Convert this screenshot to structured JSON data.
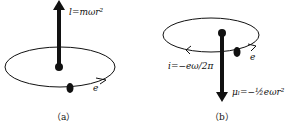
{
  "panels": [
    {
      "id": "a",
      "caption": "（a）",
      "vector_label": "l=mωr²",
      "charge_label": "e"
    },
    {
      "id": "b",
      "caption": "（b）",
      "vector_label": "μₗ=−½eωr²",
      "current_label": "i=−eω/2π",
      "charge_label": "e"
    }
  ]
}
